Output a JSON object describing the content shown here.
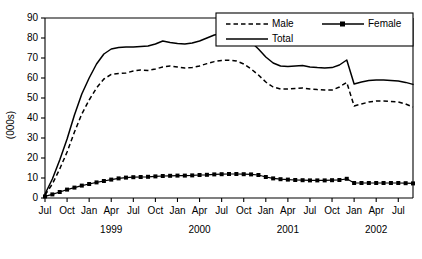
{
  "chart_data": {
    "type": "line",
    "title": "",
    "xlabel": "",
    "ylabel": "(000s)",
    "ylim": [
      0,
      90
    ],
    "ytick_values": [
      0,
      10,
      20,
      30,
      40,
      50,
      60,
      70,
      80,
      90
    ],
    "grid": false,
    "legend_position": "top-right",
    "x": [
      "Jul 1998",
      "Aug 1998",
      "Sep 1998",
      "Oct 1998",
      "Nov 1998",
      "Dec 1998",
      "Jan 1999",
      "Feb 1999",
      "Mar 1999",
      "Apr 1999",
      "May 1999",
      "Jun 1999",
      "Jul 1999",
      "Aug 1999",
      "Sep 1999",
      "Oct 1999",
      "Nov 1999",
      "Dec 1999",
      "Jan 2000",
      "Feb 2000",
      "Mar 2000",
      "Apr 2000",
      "May 2000",
      "Jun 2000",
      "Jul 2000",
      "Aug 2000",
      "Sep 2000",
      "Oct 2000",
      "Nov 2000",
      "Dec 2000",
      "Jan 2001",
      "Feb 2001",
      "Mar 2001",
      "Apr 2001",
      "May 2001",
      "Jun 2001",
      "Jul 2001",
      "Aug 2001",
      "Sep 2001",
      "Oct 2001",
      "Nov 2001",
      "Dec 2001",
      "Jan 2002",
      "Feb 2002",
      "Mar 2002",
      "Apr 2002",
      "May 2002",
      "Jun 2002",
      "Jul 2002",
      "Aug 2002",
      "Sep 2002"
    ],
    "xtick_labels": [
      "Jul",
      "Oct",
      "Jan",
      "Apr",
      "Jul",
      "Oct",
      "Jan",
      "Apr",
      "Jul",
      "Oct",
      "Jan",
      "Apr",
      "Jul",
      "Oct",
      "Jan",
      "Apr",
      "Jul"
    ],
    "xtick_step_months": 3,
    "year_labels": [
      {
        "label": "1999",
        "center_index": 9
      },
      {
        "label": "2000",
        "center_index": 21
      },
      {
        "label": "2001",
        "center_index": 33
      },
      {
        "label": "2002",
        "center_index": 45
      }
    ],
    "series": [
      {
        "name": "Male",
        "style": "dashed",
        "marker": "none",
        "values": [
          1.5,
          7.0,
          14.5,
          23.0,
          33.0,
          42.0,
          49.0,
          55.0,
          59.5,
          61.8,
          62.2,
          62.5,
          63.5,
          64.0,
          63.8,
          64.5,
          65.5,
          66.0,
          65.5,
          65.0,
          65.2,
          66.0,
          67.2,
          68.2,
          68.8,
          68.9,
          68.5,
          67.0,
          64.5,
          61.5,
          58.0,
          55.5,
          54.5,
          54.5,
          54.8,
          55.0,
          54.5,
          54.2,
          54.0,
          54.0,
          55.5,
          57.8,
          46.0,
          47.0,
          48.0,
          48.5,
          48.5,
          48.2,
          48.0,
          47.0,
          45.5
        ]
      },
      {
        "name": "Total",
        "style": "solid",
        "marker": "none",
        "values": [
          2.0,
          9.5,
          19.0,
          29.5,
          41.5,
          52.0,
          60.0,
          67.0,
          72.0,
          74.5,
          75.2,
          75.5,
          75.5,
          75.8,
          76.0,
          77.0,
          78.5,
          77.8,
          77.2,
          77.0,
          77.5,
          78.5,
          80.0,
          81.5,
          82.3,
          82.5,
          82.2,
          80.5,
          78.0,
          74.5,
          70.5,
          67.5,
          66.0,
          65.8,
          66.0,
          66.2,
          65.5,
          65.2,
          65.0,
          65.2,
          66.5,
          69.0,
          57.0,
          58.0,
          58.8,
          59.0,
          59.0,
          58.8,
          58.5,
          57.8,
          56.8
        ]
      },
      {
        "name": "Female",
        "style": "solid",
        "marker": "square",
        "values": [
          0.8,
          1.8,
          3.0,
          4.2,
          5.2,
          6.2,
          7.0,
          7.8,
          8.5,
          9.2,
          9.8,
          10.2,
          10.4,
          10.5,
          10.6,
          10.8,
          11.0,
          11.1,
          11.2,
          11.2,
          11.3,
          11.5,
          11.6,
          11.8,
          11.9,
          12.0,
          12.0,
          11.9,
          11.8,
          11.5,
          10.5,
          9.8,
          9.4,
          9.2,
          9.0,
          8.9,
          8.8,
          8.8,
          8.8,
          8.9,
          9.0,
          9.6,
          7.5,
          7.5,
          7.5,
          7.5,
          7.5,
          7.5,
          7.5,
          7.4,
          7.3
        ]
      }
    ]
  },
  "legend": {
    "items": [
      {
        "label": "Male",
        "style": "dashed",
        "marker": "none"
      },
      {
        "label": "Female",
        "style": "solid",
        "marker": "square"
      },
      {
        "label": "Total",
        "style": "solid",
        "marker": "none"
      }
    ]
  }
}
